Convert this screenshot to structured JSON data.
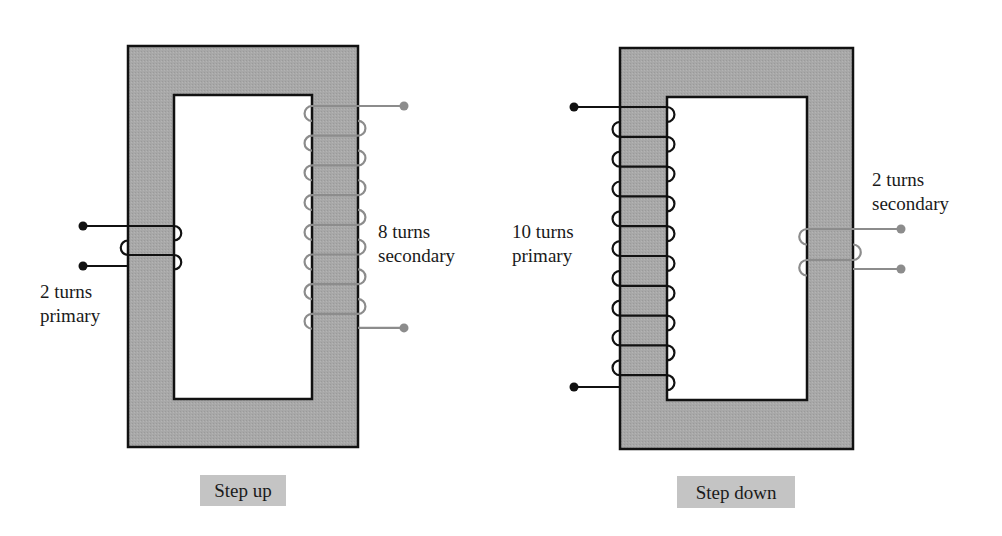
{
  "colors": {
    "core_fill": "#a6a6a6",
    "core_stroke": "#111111",
    "primary_wire": "#111111",
    "secondary_wire": "#8c8c8c",
    "caption_bg": "#c4c4c4"
  },
  "diagrams": [
    {
      "id": "step-up",
      "caption": "Step up",
      "primary": {
        "turns": 2,
        "label_line1": "2 turns",
        "label_line2": "primary"
      },
      "secondary": {
        "turns": 8,
        "label_line1": "8 turns",
        "label_line2": "secondary"
      }
    },
    {
      "id": "step-down",
      "caption": "Step down",
      "primary": {
        "turns": 10,
        "label_line1": "10 turns",
        "label_line2": "primary"
      },
      "secondary": {
        "turns": 2,
        "label_line1": "2 turns",
        "label_line2": "secondary"
      }
    }
  ]
}
